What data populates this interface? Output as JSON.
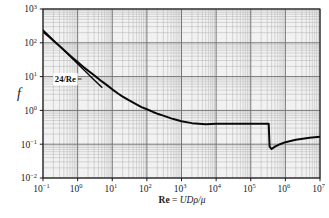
{
  "figure": {
    "title": "",
    "caption_fragment": ""
  },
  "axes": {
    "x": {
      "title_upright": "Re",
      "title_equals": " = ",
      "title_italic": "UDρ/μ",
      "title_full": "Re = UDρ/μ",
      "scale": "log",
      "min_exp": -1,
      "max_exp": 7,
      "tick_labels": [
        {
          "mant": "10",
          "exp": "−1"
        },
        {
          "mant": "10",
          "exp": "0"
        },
        {
          "mant": "10",
          "exp": "1"
        },
        {
          "mant": "10",
          "exp": "2"
        },
        {
          "mant": "10",
          "exp": "3"
        },
        {
          "mant": "10",
          "exp": "4"
        },
        {
          "mant": "10",
          "exp": "5"
        },
        {
          "mant": "10",
          "exp": "6"
        },
        {
          "mant": "10",
          "exp": "7"
        }
      ]
    },
    "y": {
      "title": "f",
      "scale": "log",
      "min_exp": -2,
      "max_exp": 3,
      "tick_labels": [
        {
          "mant": "10",
          "exp": "3"
        },
        {
          "mant": "10",
          "exp": "2"
        },
        {
          "mant": "10",
          "exp": "1"
        },
        {
          "mant": "10",
          "exp": "0"
        },
        {
          "mant": "10",
          "exp": "−1"
        },
        {
          "mant": "10",
          "exp": "−2"
        }
      ]
    }
  },
  "annotations": [
    {
      "name": "stokes-law-label",
      "text": "24/Re",
      "x_data": 0.22,
      "y_data": 8.5
    }
  ],
  "colors": {
    "curve": "#0a0a0a",
    "axis": "#1a1a1a",
    "grid_major": "#777777",
    "grid_minor": "#b8b8b8",
    "plot_background": "#f2f2f2",
    "page_background": "#ffffff",
    "text": "#1a1a1a",
    "annotation_box": "#ffffff"
  },
  "chart_data": {
    "type": "line",
    "title": "",
    "xlabel": "Re = UDρ/μ",
    "ylabel": "f",
    "xscale": "log",
    "yscale": "log",
    "xlim": [
      0.1,
      10000000
    ],
    "ylim": [
      0.01,
      1000
    ],
    "grid": true,
    "minor_grid": true,
    "legend": "none",
    "series": [
      {
        "name": "drag coefficient (sphere)",
        "linewidth": 2.0,
        "color": "#0a0a0a",
        "x": [
          0.1,
          0.15,
          0.2,
          0.3,
          0.5,
          0.7,
          1.0,
          1.5,
          2.0,
          3.0,
          5.0,
          7.0,
          10,
          15,
          20,
          30,
          50,
          70,
          100,
          150,
          200,
          300,
          500,
          700,
          1000,
          2000,
          5000,
          10000,
          30000,
          100000,
          200000,
          300000,
          330000,
          350000,
          400000,
          500000,
          700000,
          1000000,
          2000000,
          5000000,
          10000000
        ],
        "y": [
          215,
          150,
          115,
          80,
          50,
          37,
          27,
          19,
          15,
          11,
          7.2,
          5.6,
          4.2,
          3.1,
          2.55,
          2.0,
          1.5,
          1.25,
          1.08,
          0.9,
          0.8,
          0.7,
          0.58,
          0.53,
          0.48,
          0.42,
          0.39,
          0.4,
          0.4,
          0.4,
          0.4,
          0.4,
          0.4,
          0.085,
          0.072,
          0.085,
          0.1,
          0.115,
          0.135,
          0.155,
          0.165
        ]
      },
      {
        "name": "24/Re (Stokes law)",
        "linewidth": 1.4,
        "color": "#0a0a0a",
        "x": [
          0.1,
          0.3,
          1.0,
          3.0,
          5.0
        ],
        "y": [
          240,
          80,
          24,
          8.0,
          4.8
        ]
      }
    ],
    "annotations": [
      {
        "text": "24/Re",
        "x": 0.22,
        "y": 8.5,
        "leader_to_x": 1.3,
        "leader_to_y": 8.5
      }
    ]
  }
}
